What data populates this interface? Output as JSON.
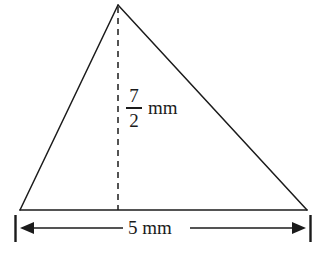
{
  "figure": {
    "kind": "geometry-diagram",
    "shape": "triangle",
    "background_color": "#ffffff",
    "stroke_color": "#1b1b1b",
    "text_color": "#1b1b1b",
    "height_label": {
      "numerator": "7",
      "denominator": "2",
      "unit": "mm"
    },
    "base_label": {
      "text": "5 mm"
    },
    "geometry": {
      "apex": {
        "x": 118,
        "y": 5
      },
      "base_left": {
        "x": 20,
        "y": 210
      },
      "base_right": {
        "x": 307,
        "y": 210
      },
      "altitude_x": 118,
      "dimension_line_y": 228,
      "dimension_tick_left_x": 15,
      "dimension_tick_right_x": 311
    }
  }
}
